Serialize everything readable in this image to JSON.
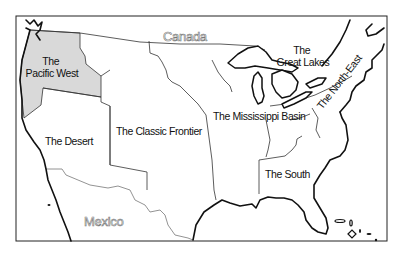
{
  "map": {
    "title": "Regions of the United States",
    "frame": {
      "x": 16,
      "y": 16,
      "width": 371,
      "height": 225
    },
    "colors": {
      "highlight_region": "#d9d9d9",
      "background": "#ffffff",
      "outline": "#111111",
      "country_label_stroke": "#777777"
    },
    "countries": [
      {
        "name": "Canada",
        "x": 163,
        "y": 41
      },
      {
        "name": "Mexico",
        "x": 84,
        "y": 226
      }
    ],
    "regions": [
      {
        "id": "pacific-west",
        "line1": "The",
        "line2": "Pacific West",
        "highlighted": true
      },
      {
        "id": "desert",
        "line1": "The Desert",
        "highlighted": false
      },
      {
        "id": "classic-frontier",
        "line1": "The Classic Frontier",
        "highlighted": false
      },
      {
        "id": "mississippi-basin",
        "line1": "The Mississippi Basin",
        "highlighted": false
      },
      {
        "id": "great-lakes",
        "line1": "The",
        "line2": "Great Lakes",
        "highlighted": false
      },
      {
        "id": "north-east",
        "line1": "The North-East",
        "highlighted": false
      },
      {
        "id": "south",
        "line1": "The South",
        "highlighted": false
      }
    ]
  }
}
